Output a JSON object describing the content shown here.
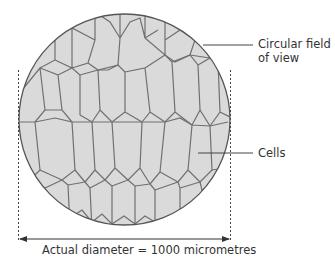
{
  "diagram": {
    "labels": {
      "field_line1": "Circular field",
      "field_line2": "of view",
      "cells": "Cells",
      "diameter": "Actual diameter = 1000 micrometres"
    },
    "colors": {
      "cell_fill": "#dadada",
      "cell_wall": "#6e6e6e",
      "outline": "#555555",
      "text": "#333333"
    }
  }
}
